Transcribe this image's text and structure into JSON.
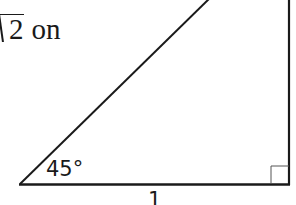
{
  "text_fragment": {
    "radicand": "2",
    "trailing_text": "on"
  },
  "triangle": {
    "angle_label": "45°",
    "base_label": "1",
    "right_angle_marker": true
  },
  "colors": {
    "ink": "#1a1a1a",
    "background": "#ffffff"
  }
}
